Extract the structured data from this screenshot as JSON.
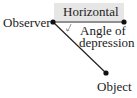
{
  "diagram": {
    "labels": {
      "observer": "Observer",
      "horizontal": "Horizontal",
      "angle_line1": "Angle of",
      "angle_line2": "depression",
      "object": "Object"
    },
    "points": {
      "observer": [
        53,
        22
      ],
      "horizontal_end": [
        124,
        22
      ],
      "object": [
        106,
        73
      ]
    },
    "colors": {
      "line": "#222222",
      "highlight": "#e6e6e6",
      "arc": "#888888"
    }
  }
}
